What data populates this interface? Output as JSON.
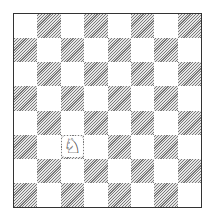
{
  "board": {
    "files": 8,
    "ranks": 8,
    "top_left_color": "light",
    "light_color": "#ffffff",
    "dark_pattern": "diagonal-hatch",
    "dark_hatch_color": "#7a7a7a",
    "border_color": "#333333"
  },
  "pieces": [
    {
      "type": "knight",
      "color": "white",
      "glyph": "♘",
      "row": 5,
      "col": 2,
      "square": "c3",
      "icon": "white-knight-icon"
    }
  ]
}
